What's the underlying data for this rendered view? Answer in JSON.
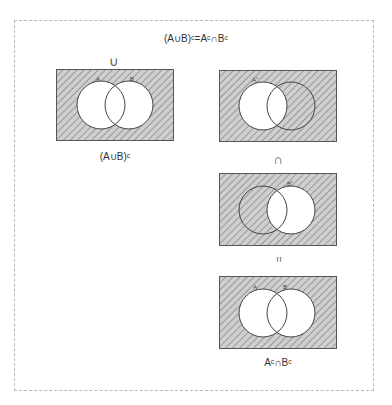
{
  "header": {
    "cut_text": "− ∓ − ∓",
    "title": "(A∪B)ᶜ=Aᶜ∩Bᶜ"
  },
  "colors": {
    "fill": "#c9c9c9",
    "hatch": "#8a8a8a",
    "stroke": "#444444",
    "frame": "#b8b8b8"
  },
  "left": {
    "operator": "∪",
    "diagram": {
      "shaded": "complement of A union B",
      "label_a": "A",
      "label_b": "B"
    },
    "caption": "(A∪B)ᶜ"
  },
  "right": {
    "diagram_1": {
      "shaded": "A complement",
      "label_a": "Aᶜ"
    },
    "operator_1": "∩",
    "diagram_2": {
      "shaded": "B complement",
      "label_b": "Bᶜ"
    },
    "operator_2": "=",
    "diagram_3": {
      "shaded": "A complement intersect B complement",
      "label_a": "A",
      "label_b": "B"
    },
    "caption": "Aᶜ∩Bᶜ"
  }
}
